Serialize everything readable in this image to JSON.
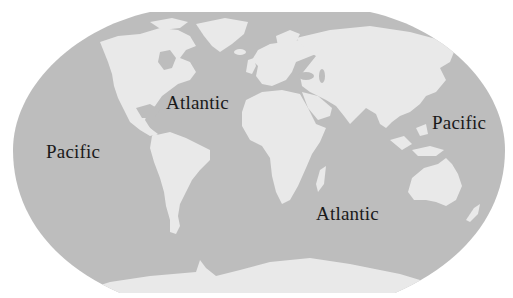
{
  "map": {
    "projection": "world-map-elliptical",
    "colors": {
      "ocean": "#bdbdbd",
      "land": "#e9e9e9",
      "label": "#1a1a1a",
      "background": "#ffffff"
    },
    "labels": [
      {
        "id": "pacific-west",
        "text": "Pacific",
        "x": 46,
        "y": 142
      },
      {
        "id": "atlantic-north",
        "text": "Atlantic",
        "x": 166,
        "y": 93
      },
      {
        "id": "atlantic-south",
        "text": "Atlantic",
        "x": 316,
        "y": 204
      },
      {
        "id": "pacific-east",
        "text": "Pacific",
        "x": 432,
        "y": 113
      }
    ]
  }
}
